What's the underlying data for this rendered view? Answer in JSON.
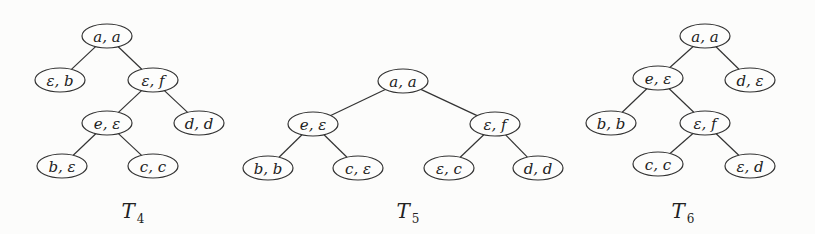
{
  "trees": [
    {
      "id": "T4",
      "label": "T",
      "subscript": "4",
      "label_pos": [
        133,
        218
      ],
      "nodes": [
        {
          "id": "r",
          "text": "a, a",
          "x": 107,
          "y": 36
        },
        {
          "id": "n1",
          "text": "ε, b",
          "x": 60,
          "y": 80
        },
        {
          "id": "n2",
          "text": "ε, f",
          "x": 153,
          "y": 80
        },
        {
          "id": "n3",
          "text": "e, ε",
          "x": 107,
          "y": 123
        },
        {
          "id": "n4",
          "text": "d, d",
          "x": 199,
          "y": 123
        },
        {
          "id": "n5",
          "text": "b, ε",
          "x": 62,
          "y": 166
        },
        {
          "id": "n6",
          "text": "c, c",
          "x": 153,
          "y": 166
        }
      ],
      "edges": [
        [
          "r",
          "n1"
        ],
        [
          "r",
          "n2"
        ],
        [
          "n2",
          "n3"
        ],
        [
          "n2",
          "n4"
        ],
        [
          "n3",
          "n5"
        ],
        [
          "n3",
          "n6"
        ]
      ]
    },
    {
      "id": "T5",
      "label": "T",
      "subscript": "5",
      "label_pos": [
        408,
        218
      ],
      "nodes": [
        {
          "id": "r",
          "text": "a, a",
          "x": 403,
          "y": 81
        },
        {
          "id": "n1",
          "text": "e, ε",
          "x": 313,
          "y": 124
        },
        {
          "id": "n2",
          "text": "ε, f",
          "x": 495,
          "y": 124
        },
        {
          "id": "n3",
          "text": "b, b",
          "x": 268,
          "y": 168
        },
        {
          "id": "n4",
          "text": "c, ε",
          "x": 358,
          "y": 168
        },
        {
          "id": "n5",
          "text": "ε, c",
          "x": 449,
          "y": 168
        },
        {
          "id": "n6",
          "text": "d, d",
          "x": 538,
          "y": 168
        }
      ],
      "edges": [
        [
          "r",
          "n1"
        ],
        [
          "r",
          "n2"
        ],
        [
          "n1",
          "n3"
        ],
        [
          "n1",
          "n4"
        ],
        [
          "n2",
          "n5"
        ],
        [
          "n2",
          "n6"
        ]
      ]
    },
    {
      "id": "T6",
      "label": "T",
      "subscript": "6",
      "label_pos": [
        683,
        218
      ],
      "nodes": [
        {
          "id": "r",
          "text": "a, a",
          "x": 705,
          "y": 36
        },
        {
          "id": "n1",
          "text": "e, ε",
          "x": 658,
          "y": 78
        },
        {
          "id": "n2",
          "text": "d, ε",
          "x": 750,
          "y": 80
        },
        {
          "id": "n3",
          "text": "b, b",
          "x": 611,
          "y": 123
        },
        {
          "id": "n4",
          "text": "ε, f",
          "x": 705,
          "y": 123
        },
        {
          "id": "n5",
          "text": "c, c",
          "x": 658,
          "y": 164
        },
        {
          "id": "n6",
          "text": "ε, d",
          "x": 750,
          "y": 166
        }
      ],
      "edges": [
        [
          "r",
          "n1"
        ],
        [
          "r",
          "n2"
        ],
        [
          "n1",
          "n3"
        ],
        [
          "n1",
          "n4"
        ],
        [
          "n4",
          "n5"
        ],
        [
          "n4",
          "n6"
        ]
      ]
    }
  ],
  "style": {
    "stroke": "#333333",
    "fill": "#fdfdfc",
    "background": "#fcfcfb"
  }
}
